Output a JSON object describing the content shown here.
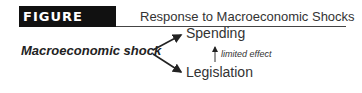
{
  "figure": {
    "label": "FIGURE 18.3",
    "title": "Response to Macroeconomic Shocks"
  },
  "diagram": {
    "nodes": {
      "source": "Macroeconomic shock",
      "top": "Spending",
      "bottom": "Legislation"
    },
    "edges": [
      {
        "from": "Macroeconomic shock",
        "to": "Spending"
      },
      {
        "from": "Macroeconomic shock",
        "to": "Legislation"
      },
      {
        "from": "Legislation",
        "to": "Spending",
        "label": "limited effect"
      }
    ],
    "edge_label": "limited effect"
  }
}
